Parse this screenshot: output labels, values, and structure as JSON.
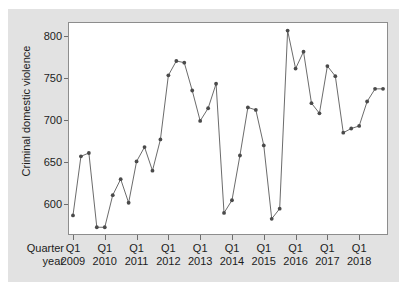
{
  "chart_data": {
    "type": "line",
    "title": "",
    "subtitle": "",
    "xlabel": "",
    "ylabel": "Criminal domestic violence",
    "row_label_quarter": "Quarter",
    "row_label_year": "year",
    "grid": false,
    "legend": "none",
    "marker": "filled-circle",
    "line_color": "#5a5a5a",
    "marker_color": "#4a4a4a",
    "plot_bg_color": "#ffffff",
    "figure_bg_color": "#e2e2e2",
    "frame_color": "#8d8d8d",
    "ylim": [
      565,
      815
    ],
    "yticks": [
      600,
      650,
      700,
      750,
      800
    ],
    "ytick_labels": [
      "600",
      "650",
      "700",
      "750",
      "800"
    ],
    "xtick_quarter_labels": [
      "Q1",
      "Q1",
      "Q1",
      "Q1",
      "Q1",
      "Q1",
      "Q1",
      "Q1",
      "Q1",
      "Q1"
    ],
    "xtick_year_labels": [
      "2009",
      "2010",
      "2011",
      "2012",
      "2013",
      "2014",
      "2015",
      "2016",
      "2017",
      "2018"
    ],
    "x": [
      "Q1 2009",
      "Q2 2009",
      "Q3 2009",
      "Q4 2009",
      "Q1 2010",
      "Q2 2010",
      "Q3 2010",
      "Q4 2010",
      "Q1 2011",
      "Q2 2011",
      "Q3 2011",
      "Q4 2011",
      "Q1 2012",
      "Q2 2012",
      "Q3 2012",
      "Q4 2012",
      "Q1 2013",
      "Q2 2013",
      "Q3 2013",
      "Q4 2013",
      "Q1 2014",
      "Q2 2014",
      "Q3 2014",
      "Q4 2014",
      "Q1 2015",
      "Q2 2015",
      "Q3 2015",
      "Q4 2015",
      "Q1 2016",
      "Q2 2016",
      "Q3 2016",
      "Q4 2016",
      "Q1 2017",
      "Q2 2017",
      "Q3 2017",
      "Q4 2017",
      "Q1 2018",
      "Q2 2018",
      "Q3 2018",
      "Q4 2018"
    ],
    "values": [
      587,
      657,
      661,
      573,
      573,
      611,
      630,
      602,
      651,
      668,
      640,
      677,
      753,
      770,
      768,
      735,
      699,
      714,
      743,
      590,
      605,
      658,
      715,
      712,
      670,
      583,
      595,
      806,
      761,
      781,
      720,
      708,
      764,
      752,
      685,
      690,
      693,
      722,
      737,
      737
    ],
    "n_points": 40,
    "min_value": 573,
    "max_value": 806
  }
}
